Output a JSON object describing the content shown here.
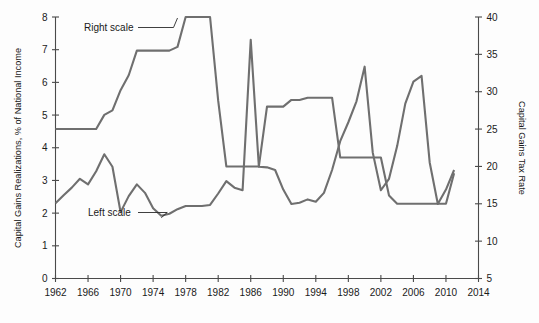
{
  "chart_data": {
    "type": "line",
    "title": "",
    "xlabel": "",
    "ylabel": "Capital Gains Realizations, % of National Income",
    "y2label": "Capital Gains Tax Rate",
    "xlim": [
      1962,
      2014
    ],
    "ylim": [
      0,
      8
    ],
    "y2lim": [
      5,
      40
    ],
    "grid": false,
    "legend_position": "inline-annotations",
    "x_ticks": [
      1962,
      1966,
      1970,
      1974,
      1978,
      1982,
      1986,
      1990,
      1994,
      1998,
      2002,
      2006,
      2010,
      2014
    ],
    "x_tick_labels": [
      "1962",
      "1966",
      "1970",
      "1974",
      "1978",
      "1982",
      "1986",
      "1990",
      "1994",
      "1998",
      "2002",
      "2006",
      "2010",
      "2014"
    ],
    "y_ticks": [
      0,
      1,
      2,
      3,
      4,
      5,
      6,
      7,
      8
    ],
    "y_tick_labels": [
      "0",
      "1",
      "2",
      "3",
      "4",
      "5",
      "6",
      "7",
      "8"
    ],
    "y2_ticks": [
      5,
      10,
      15,
      20,
      25,
      30,
      35,
      40
    ],
    "y2_tick_labels": [
      "5",
      "10",
      "15",
      "20",
      "25",
      "30",
      "35",
      "40"
    ],
    "annotations": [
      {
        "text": "Right scale",
        "x": 1968.2,
        "y_axis": "right",
        "target_x": 1977.0,
        "target_value": 40.0
      },
      {
        "text": "Left scale",
        "x": 1969.0,
        "y_axis": "left",
        "target_x": 1975.0,
        "target_value": 1.92
      }
    ],
    "series": [
      {
        "name": "Left scale",
        "axis": "left",
        "units": "% of National Income",
        "color": "#6f6f6f",
        "x": [
          1962,
          1963,
          1964,
          1965,
          1966,
          1967,
          1968,
          1969,
          1970,
          1971,
          1972,
          1973,
          1974,
          1975,
          1976,
          1977,
          1978,
          1979,
          1980,
          1981,
          1982,
          1983,
          1984,
          1985,
          1986,
          1987,
          1988,
          1989,
          1990,
          1991,
          1992,
          1993,
          1994,
          1995,
          1996,
          1997,
          1998,
          1999,
          2000,
          2001,
          2002,
          2003,
          2004,
          2005,
          2006,
          2007,
          2008,
          2009,
          2010,
          2011
        ],
        "values": [
          2.3,
          2.55,
          2.78,
          3.05,
          2.88,
          3.28,
          3.8,
          3.42,
          2.03,
          2.52,
          2.88,
          2.62,
          2.15,
          1.92,
          1.98,
          2.12,
          2.22,
          2.22,
          2.22,
          2.25,
          2.6,
          2.98,
          2.78,
          2.7,
          7.3,
          3.42,
          3.4,
          3.32,
          2.72,
          2.28,
          2.32,
          2.42,
          2.35,
          2.62,
          3.32,
          4.2,
          4.78,
          5.42,
          6.48,
          3.85,
          2.7,
          3.05,
          4.05,
          5.35,
          6.02,
          6.2,
          3.55,
          2.28,
          2.72,
          3.32
        ]
      },
      {
        "name": "Right scale",
        "axis": "right",
        "units": "Capital Gains Tax Rate (%)",
        "color": "#6f6f6f",
        "x": [
          1962,
          1963,
          1964,
          1965,
          1966,
          1967,
          1968,
          1969,
          1970,
          1971,
          1972,
          1973,
          1974,
          1975,
          1976,
          1977,
          1978,
          1979,
          1980,
          1981,
          1982,
          1983,
          1984,
          1985,
          1986,
          1987,
          1988,
          1989,
          1990,
          1991,
          1992,
          1993,
          1994,
          1995,
          1996,
          1997,
          1998,
          1999,
          2000,
          2001,
          2002,
          2003,
          2004,
          2005,
          2006,
          2007,
          2008,
          2009,
          2010,
          2011
        ],
        "values": [
          25.0,
          25.0,
          25.0,
          25.0,
          25.0,
          25.0,
          26.9,
          27.5,
          30.2,
          32.2,
          35.5,
          35.5,
          35.5,
          35.5,
          35.5,
          36.0,
          40.0,
          40.0,
          40.0,
          40.0,
          28.8,
          20.0,
          20.0,
          20.0,
          20.0,
          20.0,
          28.0,
          28.0,
          28.0,
          28.9,
          28.9,
          29.2,
          29.2,
          29.2,
          29.2,
          21.2,
          21.2,
          21.2,
          21.2,
          21.2,
          21.2,
          16.1,
          15.0,
          15.0,
          15.0,
          15.0,
          15.0,
          15.0,
          15.0,
          19.1
        ]
      }
    ]
  },
  "axes": {
    "left_title": "Capital Gains Realizations, % of National Income",
    "right_title": "Capital Gains Tax Rate"
  },
  "annotations": {
    "right_scale_label": "Right scale",
    "left_scale_label": "Left scale"
  },
  "colors": {
    "line": "#6f6f6f",
    "axis": "#4a4a4a",
    "text": "#1a1a1a",
    "background": "#fdfdfd"
  }
}
